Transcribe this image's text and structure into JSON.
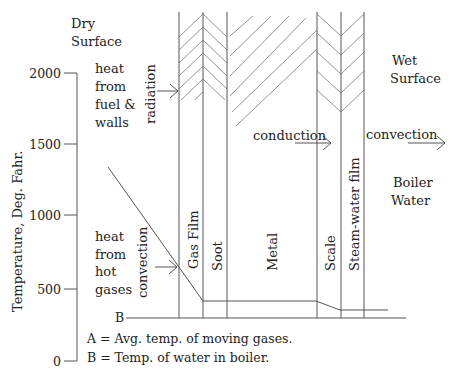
{
  "labels": {
    "dry_surface": [
      "Dry",
      "Surface"
    ],
    "wet_surface": [
      "Wet",
      "Surface"
    ],
    "boiler_water": [
      "Boiler",
      "Water"
    ],
    "heat_fuel": [
      "heat",
      "from",
      "fuel &",
      "walls"
    ],
    "heat_gases": [
      "heat",
      "from",
      "hot",
      "gases"
    ],
    "radiation": "radiation",
    "convection_left": "convection",
    "conduction": "conduction",
    "convection_right": "convection",
    "y_axis_title": "Temperature, Deg. Fahr.",
    "b_marker": "B",
    "legend_a": "A = Avg. temp. of moving gases.",
    "legend_b": "B = Temp. of water in boiler."
  },
  "layers": [
    {
      "name": "Gas Film"
    },
    {
      "name": "Soot"
    },
    {
      "name": "Metal"
    },
    {
      "name": "Scale"
    },
    {
      "name": "Steam-water film"
    }
  ],
  "y_axis": {
    "ticks": [
      {
        "label": "2000",
        "value": 2000
      },
      {
        "label": "1500",
        "value": 1500
      },
      {
        "label": "1000",
        "value": 1000
      },
      {
        "label": "500",
        "value": 500
      },
      {
        "label": "0",
        "value": 0
      }
    ]
  },
  "colors": {
    "line": "#555555",
    "text": "#222222"
  }
}
